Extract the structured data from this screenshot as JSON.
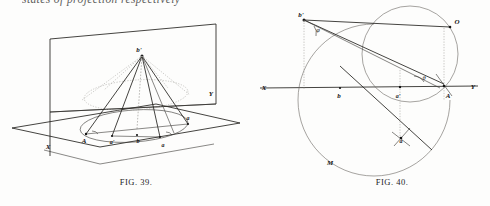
{
  "page": {
    "running_text": "states of projection respectively",
    "background": "#fdfdfc",
    "ink": "#141414"
  },
  "figure_left": {
    "caption_prefix": "F",
    "caption_smallcaps": "IG",
    "caption_number": ". 39.",
    "caption_full": "FIG. 39.",
    "description": "Oblique pictorial of a cone with apex b' standing on an elliptical base, intersected by a vertical picture plane and a horizontal ground plane",
    "labels": {
      "apex": "b'",
      "axis_x": "X",
      "axis_y": "Y",
      "base_A": "A",
      "base_a_prime": "a'",
      "base_b": "b",
      "base_a": "a",
      "rim_right": "a"
    }
  },
  "figure_right": {
    "caption_prefix": "F",
    "caption_smallcaps": "IG",
    "caption_number": ". 40.",
    "caption_full": "FIG. 40.",
    "description": "Plane construction: ground line X-Y with circle through O and A, revolved point a below, arc M, apex b' above",
    "labels": {
      "apex": "b'",
      "circle_top": "O",
      "axis_left": "X",
      "axis_right": "Y",
      "point_b": "b",
      "point_a_prime": "a'",
      "point_A": "A",
      "point_a": "a",
      "arc_M": "M",
      "angle_phi": "φ",
      "angle_theta": "θ"
    }
  }
}
